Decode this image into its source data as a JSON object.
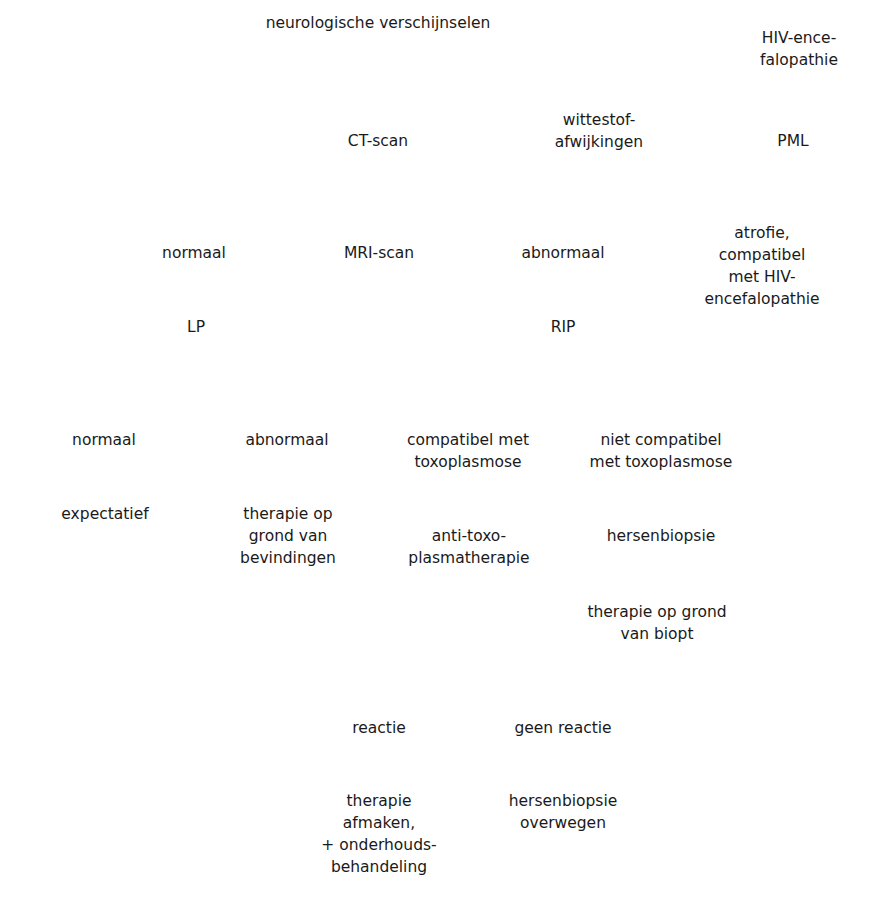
{
  "diagram": {
    "type": "decision-flowchart",
    "language": "nl",
    "nodes": {
      "root": "neurologische verschijnselen",
      "ct_scan": "CT-scan",
      "wittestof": "wittestof-\nafwijkingen",
      "hiv_ence_top": "HIV-ence-\nfalopathie",
      "pml": "PML",
      "normaal_ct": "normaal",
      "mri_scan": "MRI-scan",
      "abnormaal_ct": "abnormaal",
      "atrofie": "atrofie, compatibel\nmet HIV-\nencefalopathie",
      "lp": "LP",
      "rip": "RIP",
      "normaal_lp": "normaal",
      "abnormaal_lp": "abnormaal",
      "compatibel_toxo": "compatibel met\ntoxoplasmose",
      "niet_compatibel_toxo": "niet compatibel\nmet toxoplasmose",
      "expectatief": "expectatief",
      "therapie_bevindingen": "therapie op\ngrond van\nbevindingen",
      "anti_toxo": "anti-toxo-\nplasmatherapie",
      "hersenbiopsie": "hersenbiopsie",
      "therapie_biopt": "therapie op grond\nvan biopt",
      "reactie": "reactie",
      "geen_reactie": "geen reactie",
      "therapie_afmaken": "therapie\nafmaken,\n+ onderhouds-\nbehandeling",
      "hersenbiopsie_overwegen": "hersenbiopsie\noverwegen"
    },
    "edges": [
      [
        "root",
        "ct_scan"
      ],
      [
        "ct_scan",
        "wittestof"
      ],
      [
        "wittestof",
        "hiv_ence_top"
      ],
      [
        "wittestof",
        "pml"
      ],
      [
        "ct_scan",
        "normaal_ct"
      ],
      [
        "ct_scan",
        "mri_scan"
      ],
      [
        "ct_scan",
        "abnormaal_ct"
      ],
      [
        "ct_scan",
        "atrofie"
      ],
      [
        "normaal_ct",
        "lp"
      ],
      [
        "mri_scan",
        "lp"
      ],
      [
        "abnormaal_ct",
        "rip"
      ],
      [
        "lp",
        "normaal_lp"
      ],
      [
        "lp",
        "abnormaal_lp"
      ],
      [
        "rip",
        "compatibel_toxo"
      ],
      [
        "rip",
        "niet_compatibel_toxo"
      ],
      [
        "normaal_lp",
        "expectatief"
      ],
      [
        "abnormaal_lp",
        "therapie_bevindingen"
      ],
      [
        "compatibel_toxo",
        "anti_toxo"
      ],
      [
        "niet_compatibel_toxo",
        "hersenbiopsie"
      ],
      [
        "hersenbiopsie",
        "therapie_biopt"
      ],
      [
        "anti_toxo",
        "reactie"
      ],
      [
        "anti_toxo",
        "geen_reactie"
      ],
      [
        "reactie",
        "therapie_afmaken"
      ],
      [
        "geen_reactie",
        "hersenbiopsie_overwegen"
      ]
    ]
  }
}
